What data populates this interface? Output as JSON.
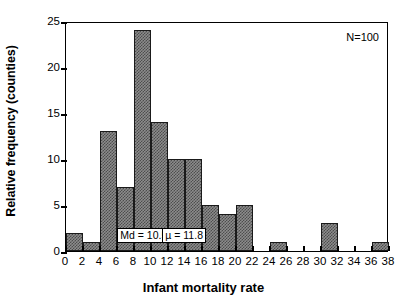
{
  "figure": {
    "background_color": "#ffffff",
    "bar_fill_color": "#8c8c8c",
    "bar_edge_color": "#1a1a1a",
    "axis_color": "#000000"
  },
  "axes": {
    "xlabel": "Infant mortality rate",
    "ylabel": "Relative frequency (counties)",
    "x_ticks": [
      "0",
      "2",
      "4",
      "6",
      "8",
      "10",
      "12",
      "14",
      "16",
      "18",
      "20",
      "22",
      "24",
      "26",
      "28",
      "30",
      "32",
      "34",
      "36",
      "38"
    ],
    "y_ticks": [
      "0",
      "5",
      "10",
      "15",
      "20",
      "25"
    ]
  },
  "annotations": {
    "sample_size": "N=100",
    "median": "Md = 10.5",
    "mean": "µ = 11.8"
  },
  "chart_data": {
    "type": "bar",
    "title": "",
    "subtitle": "",
    "xlabel": "Infant mortality rate",
    "ylabel": "Relative frequency (counties)",
    "xlim": [
      0,
      38
    ],
    "ylim": [
      0,
      25
    ],
    "grid": false,
    "legend": false,
    "bin_width": 2,
    "bin_edges": [
      0,
      2,
      4,
      6,
      8,
      10,
      12,
      14,
      16,
      18,
      20,
      22,
      24,
      26,
      28,
      30,
      32,
      34,
      36,
      38
    ],
    "categories": [
      "0-2",
      "2-4",
      "4-6",
      "6-8",
      "8-10",
      "10-12",
      "12-14",
      "14-16",
      "16-18",
      "18-20",
      "20-22",
      "22-24",
      "24-26",
      "26-28",
      "28-30",
      "30-32",
      "32-34",
      "34-36",
      "36-38"
    ],
    "values": [
      2,
      1,
      13,
      7,
      24,
      14,
      10,
      10,
      5,
      4,
      5,
      0,
      1,
      0,
      0,
      3,
      0,
      0,
      1
    ],
    "x_tick_values": [
      0,
      2,
      4,
      6,
      8,
      10,
      12,
      14,
      16,
      18,
      20,
      22,
      24,
      26,
      28,
      30,
      32,
      34,
      36,
      38
    ],
    "y_tick_values": [
      0,
      5,
      10,
      15,
      20,
      25
    ],
    "annotations": [
      {
        "text": "N=100",
        "position": "top-right"
      },
      {
        "text": "Md = 10.5",
        "x": 10.5,
        "y": 1.5
      },
      {
        "text": "µ = 11.8",
        "x": 11.8,
        "y": 1.5
      }
    ],
    "total_count": 100
  }
}
